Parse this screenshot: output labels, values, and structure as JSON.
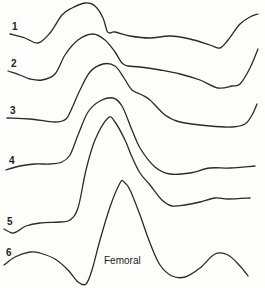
{
  "chart_data": {
    "type": "line",
    "title": "",
    "xlabel": "",
    "ylabel": "",
    "grid": false,
    "legend": "none",
    "annotation": "Femoral",
    "series": [
      {
        "name": "1",
        "points": [
          [
            10,
            34
          ],
          [
            25,
            38
          ],
          [
            38,
            43
          ],
          [
            50,
            33
          ],
          [
            62,
            15
          ],
          [
            72,
            8
          ],
          [
            85,
            3
          ],
          [
            95,
            6
          ],
          [
            103,
            18
          ],
          [
            107,
            31
          ],
          [
            110,
            33
          ],
          [
            115,
            32
          ],
          [
            130,
            36
          ],
          [
            150,
            38
          ],
          [
            170,
            36
          ],
          [
            190,
            39
          ],
          [
            210,
            45
          ],
          [
            220,
            48
          ],
          [
            228,
            40
          ],
          [
            240,
            24
          ],
          [
            250,
            17
          ],
          [
            258,
            14
          ]
        ]
      },
      {
        "name": "2",
        "points": [
          [
            8,
            71
          ],
          [
            20,
            75
          ],
          [
            30,
            79
          ],
          [
            42,
            80
          ],
          [
            55,
            74
          ],
          [
            65,
            55
          ],
          [
            78,
            40
          ],
          [
            93,
            34
          ],
          [
            105,
            40
          ],
          [
            115,
            52
          ],
          [
            122,
            63
          ],
          [
            128,
            66
          ],
          [
            140,
            67
          ],
          [
            160,
            70
          ],
          [
            180,
            74
          ],
          [
            200,
            80
          ],
          [
            218,
            88
          ],
          [
            232,
            86
          ],
          [
            240,
            84
          ],
          [
            250,
            68
          ],
          [
            258,
            49
          ]
        ]
      },
      {
        "name": "3",
        "points": [
          [
            7,
            118
          ],
          [
            30,
            119
          ],
          [
            55,
            122
          ],
          [
            66,
            119
          ],
          [
            72,
            108
          ],
          [
            80,
            90
          ],
          [
            90,
            72
          ],
          [
            103,
            64
          ],
          [
            115,
            66
          ],
          [
            124,
            78
          ],
          [
            132,
            90
          ],
          [
            142,
            95
          ],
          [
            150,
            100
          ],
          [
            165,
            115
          ],
          [
            180,
            122
          ],
          [
            210,
            126
          ],
          [
            232,
            127
          ],
          [
            245,
            124
          ],
          [
            252,
            115
          ],
          [
            257,
            104
          ]
        ]
      },
      {
        "name": "4",
        "points": [
          [
            6,
            170
          ],
          [
            20,
            166
          ],
          [
            35,
            164
          ],
          [
            50,
            164
          ],
          [
            62,
            162
          ],
          [
            70,
            155
          ],
          [
            78,
            135
          ],
          [
            88,
            112
          ],
          [
            100,
            101
          ],
          [
            113,
            98
          ],
          [
            122,
            106
          ],
          [
            132,
            130
          ],
          [
            140,
            148
          ],
          [
            155,
            167
          ],
          [
            170,
            174
          ],
          [
            190,
            173
          ],
          [
            210,
            168
          ],
          [
            230,
            168
          ],
          [
            255,
            166
          ]
        ]
      },
      {
        "name": "5",
        "points": [
          [
            4,
            229
          ],
          [
            12,
            233
          ],
          [
            18,
            231
          ],
          [
            26,
            226
          ],
          [
            40,
            223
          ],
          [
            60,
            222
          ],
          [
            70,
            220
          ],
          [
            78,
            208
          ],
          [
            86,
            170
          ],
          [
            95,
            140
          ],
          [
            108,
            118
          ],
          [
            115,
            122
          ],
          [
            125,
            140
          ],
          [
            132,
            157
          ],
          [
            140,
            173
          ],
          [
            150,
            185
          ],
          [
            162,
            200
          ],
          [
            172,
            206
          ],
          [
            185,
            205
          ],
          [
            200,
            202
          ],
          [
            215,
            198
          ],
          [
            228,
            199
          ],
          [
            250,
            198
          ]
        ]
      },
      {
        "name": "6",
        "points": [
          [
            4,
            265
          ],
          [
            15,
            257
          ],
          [
            30,
            252
          ],
          [
            40,
            253
          ],
          [
            55,
            259
          ],
          [
            68,
            270
          ],
          [
            78,
            282
          ],
          [
            86,
            284
          ],
          [
            92,
            270
          ],
          [
            100,
            240
          ],
          [
            110,
            207
          ],
          [
            120,
            183
          ],
          [
            124,
            182
          ],
          [
            130,
            190
          ],
          [
            140,
            215
          ],
          [
            150,
            243
          ],
          [
            160,
            265
          ],
          [
            172,
            276
          ],
          [
            185,
            277
          ],
          [
            200,
            268
          ],
          [
            215,
            254
          ],
          [
            228,
            255
          ],
          [
            240,
            266
          ],
          [
            248,
            276
          ]
        ]
      }
    ],
    "xlim": [
      0,
      265
    ],
    "ylim": [
      0,
      288
    ]
  },
  "labels": {
    "trace_1": "1",
    "trace_2": "2",
    "trace_3": "3",
    "trace_4": "4",
    "trace_5": "5",
    "trace_6": "6",
    "femoral": "Femoral"
  }
}
